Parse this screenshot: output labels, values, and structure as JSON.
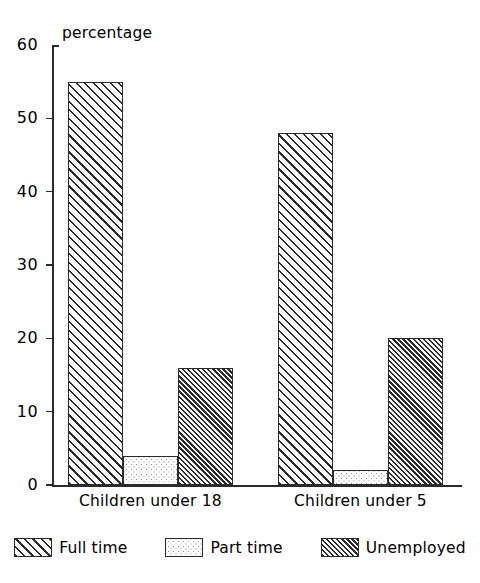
{
  "chart_data": {
    "type": "bar",
    "title": "",
    "xlabel": "",
    "ylabel": "percentage",
    "ylim": [
      0,
      60
    ],
    "yticks": [
      0,
      10,
      20,
      30,
      40,
      50,
      60
    ],
    "grid": false,
    "legend_position": "bottom",
    "categories": [
      "Children under 18",
      "Children under 5"
    ],
    "series": [
      {
        "name": "Full time",
        "pattern": "diagonal-hatch",
        "values": [
          55,
          48
        ]
      },
      {
        "name": "Part time",
        "pattern": "dotted-stipple",
        "values": [
          4,
          2
        ]
      },
      {
        "name": "Unemployed",
        "pattern": "dense-diagonal-hatch",
        "values": [
          16,
          20
        ]
      }
    ]
  },
  "axis": {
    "y_title": "percentage",
    "y_tick_labels": [
      "60",
      "50",
      "40",
      "30",
      "20",
      "10",
      "0"
    ]
  },
  "categories": [
    {
      "label": "Children under 18"
    },
    {
      "label": "Children under 5"
    }
  ],
  "legend": {
    "items": [
      {
        "label": "Full time"
      },
      {
        "label": "Part time"
      },
      {
        "label": "Unemployed"
      }
    ]
  },
  "colors": {
    "ink": "#2b2b2b",
    "background": "#ffffff",
    "stipple": "#8a8a8a"
  }
}
